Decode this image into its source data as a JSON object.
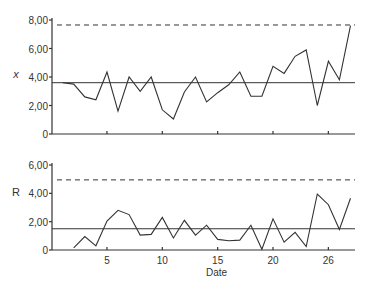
{
  "chart_data": [
    {
      "type": "line",
      "title": "",
      "ylabel": "x",
      "xlabel": "",
      "ylim": [
        0,
        8
      ],
      "yticks": [
        "0",
        "2,00",
        "4,00",
        "6,00",
        "8,00"
      ],
      "ytick_values": [
        0,
        2,
        4,
        6,
        8
      ],
      "xticks": [
        5,
        10,
        15,
        20,
        25
      ],
      "xtick_labels": [
        "5",
        "10",
        "15",
        "20",
        "26"
      ],
      "xlim": [
        0,
        27.5
      ],
      "grid": false,
      "center_line": 3.6,
      "upper_control_limit": 7.65,
      "x": [
        1,
        2,
        3,
        4,
        5,
        6,
        7,
        8,
        9,
        10,
        11,
        12,
        13,
        14,
        15,
        16,
        17,
        18,
        19,
        20,
        21,
        22,
        23,
        24,
        25,
        26,
        27
      ],
      "series": [
        {
          "name": "x",
          "values": [
            3.6,
            3.5,
            2.6,
            2.4,
            4.35,
            1.6,
            4.0,
            3.0,
            4.0,
            1.7,
            1.05,
            2.95,
            4.0,
            2.25,
            2.9,
            3.45,
            4.35,
            2.65,
            2.65,
            4.75,
            4.25,
            5.45,
            5.9,
            2.0,
            5.1,
            3.8,
            7.6
          ]
        }
      ]
    },
    {
      "type": "line",
      "title": "",
      "ylabel": "R",
      "xlabel": "Date",
      "ylim": [
        0,
        6
      ],
      "yticks": [
        "0",
        "2,00",
        "4,00",
        "6,00"
      ],
      "ytick_values": [
        0,
        2,
        4,
        6
      ],
      "xticks": [
        5,
        10,
        15,
        20,
        25
      ],
      "xtick_labels": [
        "5",
        "10",
        "15",
        "20",
        "26"
      ],
      "xlim": [
        0,
        27.5
      ],
      "grid": false,
      "center_line": 1.5,
      "upper_control_limit": 4.95,
      "x": [
        2,
        3,
        4,
        5,
        6,
        7,
        8,
        9,
        10,
        11,
        12,
        13,
        14,
        15,
        16,
        17,
        18,
        19,
        20,
        21,
        22,
        23,
        24,
        25,
        26,
        27
      ],
      "series": [
        {
          "name": "R",
          "values": [
            0.15,
            0.95,
            0.3,
            2.05,
            2.8,
            2.5,
            1.05,
            1.1,
            2.3,
            0.85,
            2.1,
            1.05,
            1.75,
            0.75,
            0.65,
            0.7,
            1.75,
            0.05,
            2.2,
            0.55,
            1.25,
            0.25,
            3.95,
            3.2,
            1.45,
            3.65
          ]
        }
      ]
    }
  ]
}
